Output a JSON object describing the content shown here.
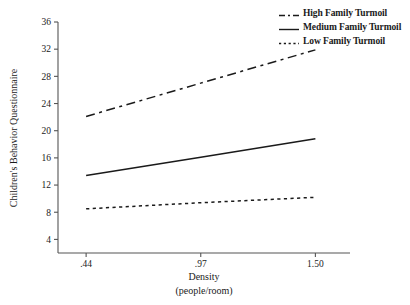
{
  "chart_data": {
    "type": "line",
    "title": "",
    "xlabel": "Density",
    "xlabel_sub": "(people/room)",
    "ylabel": "Children's Behavior Questionnaire",
    "x": [
      0.44,
      0.97,
      1.5
    ],
    "xtick_labels": [
      ".44",
      ".97",
      "1.50"
    ],
    "ytick_labels": [
      "4",
      "8",
      "12",
      "16",
      "20",
      "24",
      "28",
      "32",
      "36"
    ],
    "ytick_values": [
      4,
      8,
      12,
      16,
      20,
      24,
      28,
      32,
      36
    ],
    "ylim": [
      2,
      36
    ],
    "xlim": [
      0.31,
      1.66
    ],
    "grid": false,
    "legend_position": "top-right",
    "series": [
      {
        "name": "High Family Turmoil",
        "style": "dashed",
        "color": "#1a1a1a",
        "values": [
          22.1,
          27.0,
          31.9
        ]
      },
      {
        "name": "Medium Family Turmoil",
        "style": "solid",
        "color": "#1a1a1a",
        "values": [
          13.4,
          16.1,
          18.8
        ]
      },
      {
        "name": "Low Family Turmoil",
        "style": "dotted",
        "color": "#1a1a1a",
        "values": [
          8.5,
          9.4,
          10.2
        ]
      }
    ]
  },
  "legend": {
    "items": [
      {
        "label": "High Family Turmoil",
        "style": "dashed"
      },
      {
        "label": "Medium Family Turmoil",
        "style": "solid"
      },
      {
        "label": "Low Family Turmoil",
        "style": "dotted"
      }
    ]
  },
  "axes": {
    "y_title": "Children's Behavior Questionnaire",
    "x_title": "Density",
    "x_subtitle": "(people/room)"
  },
  "colors": {
    "line": "#1a1a1a",
    "axis": "#555555",
    "background": "#ffffff"
  }
}
